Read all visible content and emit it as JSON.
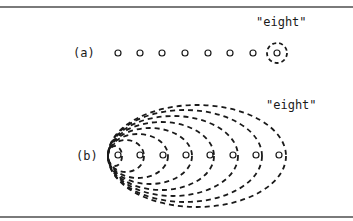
{
  "figure": {
    "panel_a": {
      "label": "(a)",
      "target_label": "\"eight\"",
      "circle_count": 8,
      "highlighted_index": 7
    },
    "panel_b": {
      "label": "(b)",
      "target_label": "\"eight\"",
      "circle_count": 8,
      "nested_ellipse_count": 8
    }
  },
  "colors": {
    "ink": "#1a1a1a",
    "rule": "#7a7a7a",
    "background": "#ffffff"
  }
}
